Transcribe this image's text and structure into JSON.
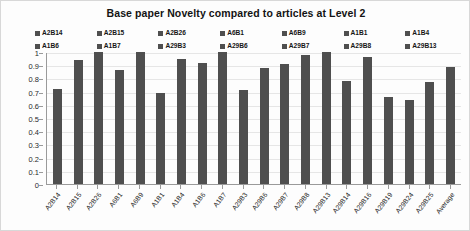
{
  "chart_data": {
    "type": "bar",
    "title": "Base paper Novelty compared to articles at Level 2",
    "xlabel": "",
    "ylabel": "",
    "ylim": [
      0,
      1
    ],
    "ytick_labels": [
      "1",
      "0.9",
      "0.8",
      "0.7",
      "0.6",
      "0.5",
      "0.4",
      "0.3",
      "0.2",
      "0.1",
      "0"
    ],
    "ytick_values": [
      1,
      0.9,
      0.8,
      0.7,
      0.6,
      0.5,
      0.4,
      0.3,
      0.2,
      0.1,
      0
    ],
    "grid": true,
    "legend_position": "top",
    "legend_entries": [
      "A2B14",
      "A2B15",
      "A2B26",
      "A6B1",
      "A6B9",
      "A1B1",
      "A1B4",
      "A1B6",
      "A1B7",
      "A29B3",
      "A29B6",
      "A29B7",
      "A29B8",
      "A29B13"
    ],
    "bar_color": "#4f4f4f",
    "categories": [
      "A2B14",
      "A2B15",
      "A2B26",
      "A6B1",
      "A6B9",
      "A1B1",
      "A1B4",
      "A1B6",
      "A1B7",
      "A29B3",
      "A29B6",
      "A29B7",
      "A29B8",
      "A29B13",
      "A29B14",
      "A29B16",
      "A29B19",
      "A29B24",
      "A29B25",
      "Average"
    ],
    "values": [
      0.72,
      0.94,
      1.0,
      0.86,
      1.0,
      0.69,
      0.95,
      0.92,
      1.0,
      0.71,
      0.88,
      0.91,
      0.98,
      1.0,
      0.78,
      0.96,
      0.66,
      0.64,
      0.77,
      0.89
    ]
  }
}
